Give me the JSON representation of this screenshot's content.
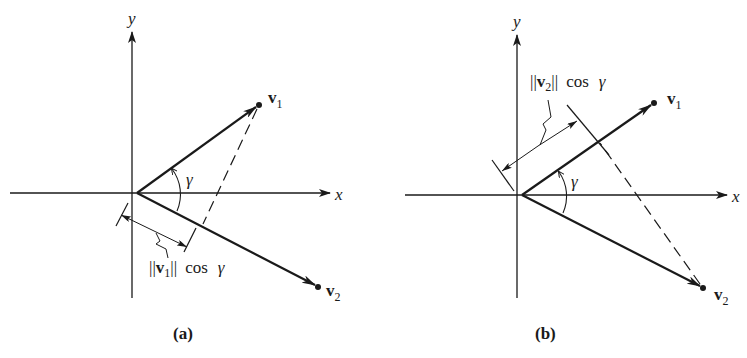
{
  "figure": {
    "ink_color": "#1a1a1a",
    "background": "#ffffff",
    "panels": [
      {
        "id": "a",
        "caption": "(a)",
        "x_axis_label": "x",
        "y_axis_label": "y",
        "vector1_label": "v",
        "vector1_sub": "1",
        "vector2_label": "v",
        "vector2_sub": "2",
        "angle_label": "γ",
        "projection_label": {
          "norm_open": "||",
          "vec": "v",
          "sub": "1",
          "norm_close": "||",
          "func": "cos",
          "angle": "γ"
        }
      },
      {
        "id": "b",
        "caption": "(b)",
        "x_axis_label": "x",
        "y_axis_label": "y",
        "vector1_label": "v",
        "vector1_sub": "1",
        "vector2_label": "v",
        "vector2_sub": "2",
        "angle_label": "γ",
        "projection_label": {
          "norm_open": "||",
          "vec": "v",
          "sub": "2",
          "norm_close": "||",
          "func": "cos",
          "angle": "γ"
        }
      }
    ]
  }
}
